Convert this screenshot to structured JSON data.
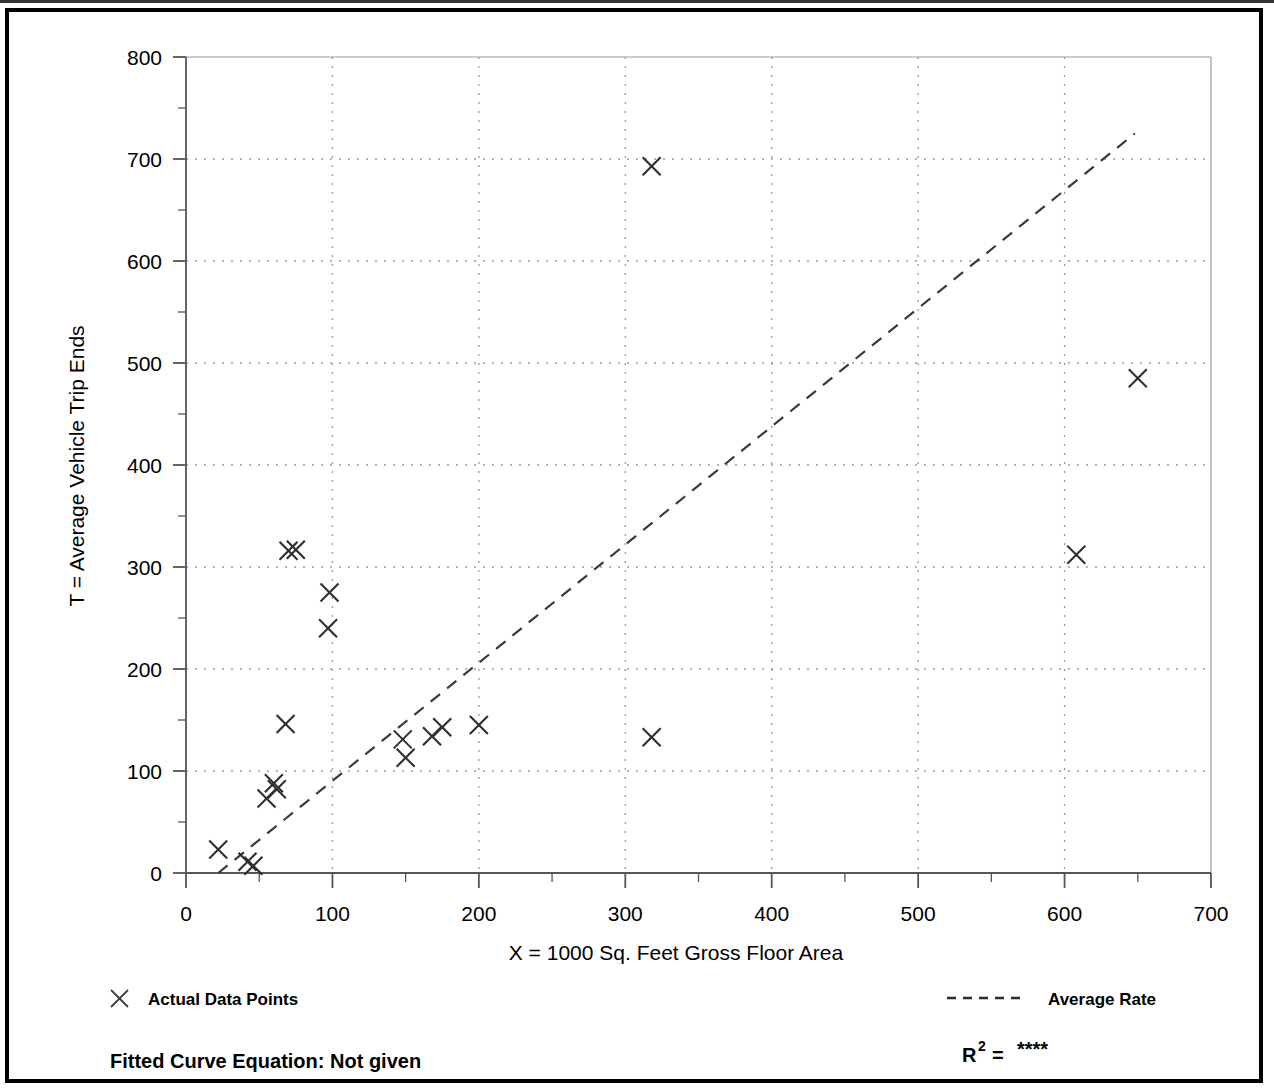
{
  "figure": {
    "has_outer_border": true,
    "background_color": "#ffffff",
    "ink_color": "#000000",
    "grid_color": "#9a9a9a",
    "axis_color": "#555555"
  },
  "legend": {
    "position": "below-plot",
    "entries": [
      {
        "id": "actual-data-points",
        "marker": "x-cross",
        "label": "Actual Data Points"
      },
      {
        "id": "average-rate",
        "marker": "dashed-line",
        "label": "Average Rate"
      }
    ]
  },
  "footer": {
    "fitted_curve_label": "Fitted Curve Equation:  Not given",
    "r2_prefix": "R",
    "r2_exponent": "2",
    "r2_equals": " = ",
    "r2_value": "****"
  },
  "chart_data": {
    "type": "scatter",
    "title": "",
    "xlabel": "X = 1000 Sq. Feet Gross Floor Area",
    "ylabel": "T = Average Vehicle Trip Ends",
    "xlim": [
      0,
      700
    ],
    "ylim": [
      0,
      800
    ],
    "xticks": [
      0,
      100,
      200,
      300,
      400,
      500,
      600,
      700
    ],
    "yticks": [
      0,
      100,
      200,
      300,
      400,
      500,
      600,
      700,
      800
    ],
    "x_minor_step": 50,
    "y_minor_step": 50,
    "grid": true,
    "grid_style": "dotted",
    "legend_position": "below",
    "series": [
      {
        "name": "Actual Data Points",
        "type": "scatter",
        "marker": "x-cross",
        "points": [
          [
            22,
            23
          ],
          [
            42,
            11
          ],
          [
            46,
            7
          ],
          [
            55,
            73
          ],
          [
            60,
            88
          ],
          [
            62,
            82
          ],
          [
            68,
            146
          ],
          [
            70,
            316
          ],
          [
            75,
            317
          ],
          [
            97,
            240
          ],
          [
            98,
            275
          ],
          [
            148,
            131
          ],
          [
            150,
            113
          ],
          [
            168,
            134
          ],
          [
            175,
            143
          ],
          [
            200,
            145
          ],
          [
            318,
            693
          ],
          [
            318,
            133
          ],
          [
            608,
            312
          ],
          [
            650,
            485
          ]
        ]
      },
      {
        "name": "Average Rate",
        "type": "line",
        "style": "dashed",
        "points": [
          [
            22,
            0
          ],
          [
            648,
            725
          ]
        ]
      }
    ]
  }
}
